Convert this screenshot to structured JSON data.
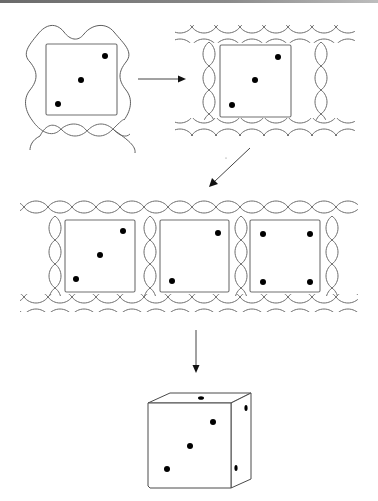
{
  "figure": {
    "colors": {
      "line": "#6b6b6b",
      "dot": "#000000",
      "background": "#ffffff",
      "top_edge": "#7a7a7a"
    },
    "steps": [
      {
        "id": 1,
        "label": "single-face-with-wavy-wrap",
        "face_pips": 3
      },
      {
        "id": 2,
        "label": "single-face-with-rope-frame",
        "face_pips": 3
      },
      {
        "id": 3,
        "label": "rope-strip-three-faces",
        "faces": [
          {
            "pips": 3
          },
          {
            "pips": 2
          },
          {
            "pips": 4
          }
        ]
      },
      {
        "id": 4,
        "label": "assembled-die",
        "front_pips": 3,
        "top_pips": 1,
        "right_pips": 2
      }
    ],
    "arrows": [
      {
        "from": 1,
        "to": 2,
        "direction": "right"
      },
      {
        "from": 2,
        "to": 3,
        "direction": "down-left"
      },
      {
        "from": 3,
        "to": 4,
        "direction": "down"
      }
    ]
  }
}
